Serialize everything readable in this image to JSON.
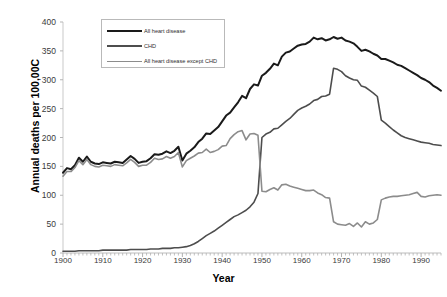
{
  "chart_data": {
    "type": "line",
    "title": "",
    "xlabel": "Year",
    "ylabel": "Annual deaths per 100,00C",
    "xlim": [
      1900,
      1995
    ],
    "ylim": [
      0,
      400
    ],
    "yticks": [
      0,
      50,
      100,
      150,
      200,
      250,
      300,
      350,
      400
    ],
    "xticks": [
      1900,
      1910,
      1920,
      1930,
      1940,
      1950,
      1960,
      1970,
      1980,
      1990
    ],
    "grid": false,
    "legend_position": "upper-left-inside",
    "x": [
      1900,
      1901,
      1902,
      1903,
      1904,
      1905,
      1906,
      1907,
      1908,
      1909,
      1910,
      1911,
      1912,
      1913,
      1914,
      1915,
      1916,
      1917,
      1918,
      1919,
      1920,
      1921,
      1922,
      1923,
      1924,
      1925,
      1926,
      1927,
      1928,
      1929,
      1930,
      1931,
      1932,
      1933,
      1934,
      1935,
      1936,
      1937,
      1938,
      1939,
      1940,
      1941,
      1942,
      1943,
      1944,
      1945,
      1946,
      1947,
      1948,
      1949,
      1950,
      1951,
      1952,
      1953,
      1954,
      1955,
      1956,
      1957,
      1958,
      1959,
      1960,
      1961,
      1962,
      1963,
      1964,
      1965,
      1966,
      1967,
      1968,
      1969,
      1970,
      1971,
      1972,
      1973,
      1974,
      1975,
      1976,
      1977,
      1978,
      1979,
      1980,
      1981,
      1982,
      1983,
      1984,
      1985,
      1986,
      1987,
      1988,
      1989,
      1990,
      1991,
      1992,
      1993,
      1994,
      1995
    ],
    "series": [
      {
        "name": "All heart disease",
        "color": "#1a1a1a",
        "width": 2.0,
        "values": [
          139,
          147,
          145,
          152,
          165,
          158,
          167,
          158,
          155,
          154,
          157,
          156,
          155,
          158,
          157,
          156,
          162,
          168,
          163,
          156,
          158,
          159,
          164,
          171,
          170,
          172,
          176,
          173,
          177,
          184,
          160,
          172,
          177,
          183,
          192,
          198,
          207,
          206,
          212,
          218,
          228,
          238,
          243,
          252,
          261,
          272,
          268,
          284,
          292,
          290,
          307,
          312,
          319,
          328,
          325,
          340,
          347,
          349,
          354,
          359,
          361,
          362,
          366,
          373,
          370,
          372,
          368,
          370,
          374,
          371,
          373,
          368,
          366,
          363,
          357,
          350,
          352,
          349,
          345,
          342,
          336,
          336,
          333,
          330,
          326,
          324,
          320,
          316,
          312,
          308,
          303,
          300,
          296,
          290,
          286,
          281
        ]
      },
      {
        "name": "CHD",
        "color": "#4d4d4d",
        "width": 1.6,
        "values": [
          3,
          3,
          3,
          3,
          4,
          4,
          4,
          4,
          4,
          4,
          5,
          5,
          5,
          5,
          5,
          5,
          5,
          6,
          6,
          6,
          6,
          6,
          7,
          7,
          7,
          8,
          8,
          8,
          9,
          9,
          10,
          11,
          13,
          16,
          20,
          25,
          30,
          34,
          38,
          43,
          48,
          53,
          58,
          63,
          66,
          70,
          74,
          80,
          88,
          103,
          200,
          206,
          209,
          215,
          216,
          222,
          228,
          233,
          240,
          247,
          251,
          254,
          258,
          264,
          266,
          271,
          272,
          275,
          320,
          318,
          314,
          307,
          303,
          300,
          299,
          289,
          287,
          282,
          277,
          271,
          230,
          225,
          219,
          213,
          208,
          203,
          200,
          198,
          196,
          194,
          192,
          191,
          190,
          188,
          187,
          186
        ]
      },
      {
        "name": "All heart disease except CHD",
        "color": "#8c8c8c",
        "width": 1.6,
        "values": [
          133,
          141,
          141,
          148,
          160,
          153,
          162,
          153,
          150,
          149,
          152,
          151,
          150,
          153,
          152,
          151,
          156,
          162,
          157,
          150,
          152,
          152,
          157,
          164,
          162,
          163,
          167,
          164,
          167,
          174,
          149,
          160,
          164,
          168,
          173,
          174,
          180,
          174,
          176,
          179,
          185,
          186,
          198,
          205,
          210,
          212,
          196,
          206,
          207,
          204,
          107,
          106,
          110,
          113,
          109,
          118,
          119,
          116,
          114,
          112,
          110,
          108,
          108,
          109,
          104,
          101,
          96,
          95,
          54,
          50,
          49,
          48,
          51,
          46,
          52,
          45,
          54,
          50,
          52,
          58,
          92,
          95,
          97,
          98,
          98,
          99,
          100,
          101,
          103,
          105,
          98,
          97,
          99,
          100,
          101,
          100
        ]
      }
    ],
    "annotations": [
      {
        "year": 1949,
        "note": "ICD coding discontinuity: CHD jumps up, all-except-CHD drops"
      },
      {
        "year": 1968,
        "note": "Second coding discontinuity"
      },
      {
        "year": 1979,
        "note": "Third coding discontinuity"
      }
    ]
  },
  "axes": {
    "ylabel": "Annual deaths per 100,00C",
    "xlabel": "Year",
    "yticks": [
      "400",
      "350",
      "300",
      "250",
      "200",
      "150",
      "100",
      "50",
      "0"
    ],
    "xticks": [
      "1900",
      "1910",
      "1920",
      "1930",
      "1940",
      "1950",
      "1960",
      "1970",
      "1980",
      "1990"
    ]
  },
  "legend": {
    "items": [
      {
        "label": "All heart disease"
      },
      {
        "label": "CHD"
      },
      {
        "label": "All heart disease except CHD"
      }
    ]
  }
}
